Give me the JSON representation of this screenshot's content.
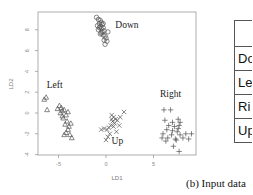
{
  "chart_data": {
    "type": "scatter",
    "title": "",
    "xlabel": "LD1",
    "ylabel": "LD2",
    "xlim": [
      -7,
      9.5
    ],
    "ylim": [
      -4.2,
      9.2
    ],
    "xticks": [
      -5,
      0,
      5
    ],
    "yticks": [
      -4,
      -2,
      0,
      2,
      4,
      6,
      8
    ],
    "grid": false,
    "legend": "none (cluster labels annotated on plot)",
    "series": [
      {
        "name": "Down",
        "marker": "circle",
        "label_pos": [
          2.2,
          8.2
        ],
        "points": [
          [
            -1.0,
            9.2
          ],
          [
            -0.8,
            9.0
          ],
          [
            -0.6,
            8.9
          ],
          [
            -0.5,
            8.7
          ],
          [
            -0.7,
            8.6
          ],
          [
            -0.4,
            8.5
          ],
          [
            -0.9,
            8.4
          ],
          [
            -0.6,
            8.3
          ],
          [
            -0.3,
            8.2
          ],
          [
            -0.5,
            8.1
          ],
          [
            -0.8,
            8.0
          ],
          [
            -0.2,
            7.9
          ],
          [
            -0.4,
            7.8
          ],
          [
            -0.6,
            7.6
          ],
          [
            -0.3,
            7.5
          ],
          [
            -0.1,
            7.4
          ],
          [
            0.0,
            7.2
          ],
          [
            -0.2,
            7.0
          ],
          [
            0.1,
            6.9
          ],
          [
            -0.1,
            6.6
          ],
          [
            -0.5,
            7.7
          ],
          [
            -0.7,
            8.2
          ],
          [
            -0.3,
            8.6
          ],
          [
            0.2,
            7.8
          ]
        ]
      },
      {
        "name": "Left",
        "marker": "triangle",
        "label_pos": [
          -5.4,
          2.4
        ],
        "points": [
          [
            -6.3,
            1.5
          ],
          [
            -6.5,
            1.3
          ],
          [
            -6.2,
            0.3
          ],
          [
            -5.1,
            0.4
          ],
          [
            -4.9,
            0.7
          ],
          [
            -4.6,
            0.2
          ],
          [
            -4.8,
            0.0
          ],
          [
            -4.4,
            0.3
          ],
          [
            -4.2,
            -0.2
          ],
          [
            -4.5,
            -0.5
          ],
          [
            -4.1,
            -0.8
          ],
          [
            -4.3,
            -1.1
          ],
          [
            -3.9,
            -1.3
          ],
          [
            -4.0,
            -1.6
          ],
          [
            -4.2,
            -1.9
          ],
          [
            -3.8,
            -2.1
          ],
          [
            -4.4,
            -2.1
          ],
          [
            -3.6,
            -2.4
          ],
          [
            -4.7,
            0.5
          ],
          [
            -4.0,
            0.1
          ],
          [
            -4.6,
            -0.3
          ],
          [
            -3.7,
            -1.0
          ]
        ]
      },
      {
        "name": "Up",
        "marker": "x",
        "label_pos": [
          1.2,
          -3.0
        ],
        "points": [
          [
            0.6,
            -0.2
          ],
          [
            0.8,
            -0.4
          ],
          [
            1.0,
            -0.6
          ],
          [
            0.7,
            -0.8
          ],
          [
            0.9,
            -1.0
          ],
          [
            1.2,
            -0.7
          ],
          [
            0.5,
            -1.2
          ],
          [
            0.3,
            -1.4
          ],
          [
            0.1,
            -1.6
          ],
          [
            -0.2,
            -1.5
          ],
          [
            -0.5,
            -1.6
          ],
          [
            1.9,
            0.1
          ],
          [
            1.4,
            -1.2
          ],
          [
            0.4,
            -2.0
          ],
          [
            0.2,
            -2.3
          ],
          [
            0.0,
            -2.6
          ],
          [
            1.1,
            -1.8
          ],
          [
            0.6,
            -0.6
          ],
          [
            0.8,
            -1.3
          ],
          [
            1.5,
            -0.4
          ]
        ]
      },
      {
        "name": "Right",
        "marker": "plus",
        "label_pos": [
          6.8,
          1.5
        ],
        "points": [
          [
            6.1,
            0.3
          ],
          [
            6.8,
            0.3
          ],
          [
            6.2,
            -0.7
          ],
          [
            7.0,
            -0.9
          ],
          [
            7.6,
            -0.6
          ],
          [
            7.8,
            -0.9
          ],
          [
            6.6,
            -1.2
          ],
          [
            7.2,
            -1.3
          ],
          [
            7.7,
            -1.2
          ],
          [
            6.4,
            -1.6
          ],
          [
            7.0,
            -1.7
          ],
          [
            7.5,
            -1.8
          ],
          [
            6.0,
            -2.0
          ],
          [
            6.9,
            -2.1
          ],
          [
            7.8,
            -2.1
          ],
          [
            8.4,
            -2.0
          ],
          [
            9.0,
            -2.0
          ],
          [
            5.9,
            -2.4
          ],
          [
            6.5,
            -2.4
          ],
          [
            7.3,
            -2.5
          ],
          [
            8.1,
            -2.4
          ],
          [
            8.7,
            -2.5
          ],
          [
            6.3,
            -2.7
          ],
          [
            7.4,
            -2.6
          ],
          [
            7.1,
            -3.2
          ],
          [
            7.7,
            -3.7
          ],
          [
            7.6,
            -1.5
          ]
        ]
      }
    ]
  },
  "side_table": {
    "rows": [
      "",
      "Do",
      "Le",
      "Ri",
      "Up"
    ]
  },
  "caption": "(b) Input data"
}
